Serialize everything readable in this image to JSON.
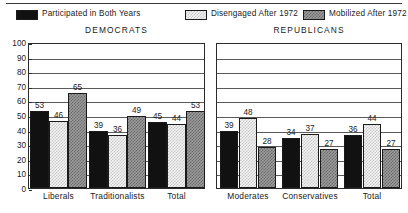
{
  "legend": {
    "items": [
      {
        "label": "Participated in Both Years",
        "swatch": "solid-black-swatch",
        "color": "#111111"
      },
      {
        "label": "Disengaged After 1972",
        "swatch": "light-checker-swatch",
        "color": "#f2f2f2"
      },
      {
        "label": "Mobilized After 1972",
        "swatch": "gray-checker-swatch",
        "color": "#9a9a9a"
      }
    ]
  },
  "panels": [
    {
      "title": "DEMOCRATS"
    },
    {
      "title": "REPUBLICANS"
    }
  ],
  "yticks": [
    "100",
    "90",
    "80",
    "70",
    "60",
    "50",
    "40",
    "30",
    "20",
    "10",
    "0"
  ],
  "chart_data": [
    {
      "type": "bar",
      "title": "DEMOCRATS",
      "xlabel": "",
      "ylabel": "",
      "ylim": [
        0,
        100
      ],
      "ytick_step": 10,
      "grid": true,
      "legend_position": "top",
      "categories": [
        "Liberals",
        "Traditionalists",
        "Total"
      ],
      "series": [
        {
          "name": "Participated in Both Years",
          "values": [
            53,
            39,
            45
          ]
        },
        {
          "name": "Disengaged After 1972",
          "values": [
            46,
            36,
            44
          ]
        },
        {
          "name": "Mobilized After 1972",
          "values": [
            65,
            49,
            53
          ]
        }
      ]
    },
    {
      "type": "bar",
      "title": "REPUBLICANS",
      "xlabel": "",
      "ylabel": "",
      "ylim": [
        0,
        100
      ],
      "ytick_step": 10,
      "grid": true,
      "legend_position": "top",
      "categories": [
        "Moderates",
        "Conservatives",
        "Total"
      ],
      "series": [
        {
          "name": "Participated in Both Years",
          "values": [
            39,
            34,
            36
          ]
        },
        {
          "name": "Disengaged After 1972",
          "values": [
            48,
            37,
            44
          ]
        },
        {
          "name": "Mobilized After 1972",
          "values": [
            28,
            27,
            27
          ]
        }
      ]
    }
  ]
}
